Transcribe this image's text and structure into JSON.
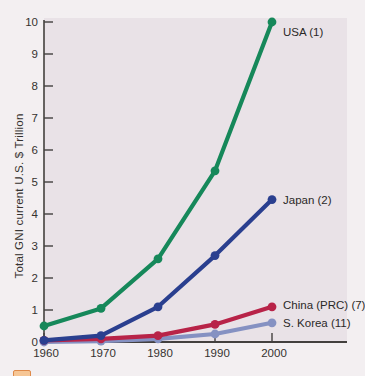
{
  "chart_data": {
    "type": "line",
    "title": "",
    "xlabel": "",
    "ylabel": "Total GNI current U.S. $ Trillion",
    "x": [
      1960,
      1970,
      1980,
      1990,
      2000
    ],
    "x_tick_labels": [
      "1960",
      "1970",
      "1980",
      "1990",
      "2000"
    ],
    "ylim": [
      0,
      10
    ],
    "yticks": [
      0,
      1,
      2,
      3,
      4,
      5,
      6,
      7,
      8,
      9,
      10
    ],
    "grid": false,
    "legend_position": "end-of-line-labels",
    "series": [
      {
        "name": "USA (1)",
        "values": [
          0.5,
          1.05,
          2.6,
          5.35,
          10.0
        ],
        "color": "#16885a"
      },
      {
        "name": "Japan (2)",
        "values": [
          0.05,
          0.2,
          1.1,
          2.7,
          4.45
        ],
        "color": "#2a3f8f"
      },
      {
        "name": "China (PRC) (7)",
        "values": [
          0.05,
          0.1,
          0.2,
          0.55,
          1.1
        ],
        "color": "#b82348"
      },
      {
        "name": "S. Korea (11)",
        "values": [
          0.0,
          0.03,
          0.1,
          0.25,
          0.6
        ],
        "color": "#8591c2"
      }
    ]
  },
  "colors": {
    "page_bg": "#f3eff1",
    "plot_bg": "#e9e2e7",
    "axis": "#43403e",
    "text": "#35322f",
    "badge_orange": "#df8a4a"
  }
}
